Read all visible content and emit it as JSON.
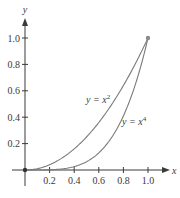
{
  "chart_data": {
    "type": "line",
    "title": "",
    "xlabel": "x",
    "ylabel": "y",
    "xlim": [
      0,
      1.0
    ],
    "ylim": [
      0,
      1.0
    ],
    "grid": false,
    "x_ticks": [
      "0.2",
      "0.4",
      "0.6",
      "0.8",
      "1.0"
    ],
    "y_ticks": [
      "0.2",
      "0.4",
      "0.6",
      "0.8",
      "1.0"
    ],
    "series": [
      {
        "name": "y = x^2",
        "label": "y = x",
        "exponent": "2",
        "x": [
          0,
          0.1,
          0.2,
          0.3,
          0.4,
          0.5,
          0.6,
          0.7,
          0.8,
          0.9,
          1.0
        ],
        "values": [
          0,
          0.01,
          0.04,
          0.09,
          0.16,
          0.25,
          0.36,
          0.49,
          0.64,
          0.81,
          1.0
        ]
      },
      {
        "name": "y = x^4",
        "label": "y = x",
        "exponent": "4",
        "x": [
          0,
          0.1,
          0.2,
          0.3,
          0.4,
          0.5,
          0.6,
          0.7,
          0.8,
          0.9,
          1.0
        ],
        "values": [
          0,
          0.0001,
          0.0016,
          0.0081,
          0.0256,
          0.0625,
          0.1296,
          0.2401,
          0.4096,
          0.6561,
          1.0
        ]
      }
    ],
    "annotations": [
      {
        "type": "point",
        "x": 0,
        "y": 0
      },
      {
        "type": "point",
        "x": 1.0,
        "y": 1.0
      }
    ],
    "colors": {
      "axis": "#3a3a3a",
      "curve": "#7a7a7a",
      "point": "#8a8a8a",
      "origin_point": "#333333"
    }
  }
}
